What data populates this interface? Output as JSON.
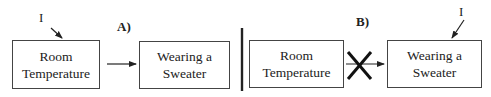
{
  "panels": {
    "a": {
      "label": "A)",
      "intervention_label": "I",
      "cause_box": {
        "line1": "Room",
        "line2": "Temperature"
      },
      "effect_box": {
        "line1": "Wearing a",
        "line2": "Sweater"
      },
      "arrow": "intact"
    },
    "b": {
      "label": "B)",
      "intervention_label": "I",
      "cause_box": {
        "line1": "Room",
        "line2": "Temperature"
      },
      "effect_box": {
        "line1": "Wearing a",
        "line2": "Sweater"
      },
      "arrow": "severed"
    }
  }
}
